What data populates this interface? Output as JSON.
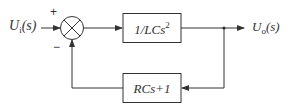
{
  "diagram": {
    "type": "feedback-control-block-diagram",
    "input": {
      "symbol": "U",
      "subscript": "i",
      "arg": "(s)"
    },
    "output": {
      "symbol": "U",
      "subscript": "o",
      "arg": "(s)"
    },
    "summing_junction": {
      "plus_sign": "+",
      "minus_sign": "−"
    },
    "forward_block": {
      "text": "1/LCs",
      "exponent": "2"
    },
    "feedback_block": {
      "text": "RCs+1"
    },
    "colors": {
      "line": "#333333",
      "background": "#ffffff"
    }
  }
}
